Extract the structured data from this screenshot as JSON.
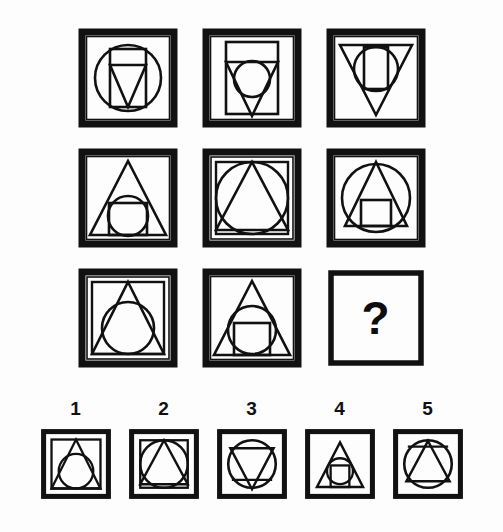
{
  "puzzle": {
    "type": "matrix-reasoning-figure",
    "background_color": "#fdfdfd",
    "ink_color": "#111111",
    "matrix": {
      "rows": 3,
      "columns": 3,
      "cells": [
        {
          "id": "r1c1",
          "position": "row1-col1",
          "outer": "thick-square-border",
          "shapes": [
            "circle-large",
            "rectangle-vertical",
            "triangle-down"
          ],
          "description": "Square frame containing a large circle, a tall vertical rectangle, and a downward-pointing triangle"
        },
        {
          "id": "r1c2",
          "position": "row1-col2",
          "outer": "thick-square-border",
          "shapes": [
            "rectangle-vertical-large",
            "triangle-down",
            "circle-medium"
          ],
          "description": "Square frame containing a large tall rectangle, a downward triangle, and a medium circle"
        },
        {
          "id": "r1c3",
          "position": "row1-col3",
          "outer": "thick-square-border",
          "shapes": [
            "triangle-down-large",
            "circle-medium",
            "rectangle-vertical-small"
          ],
          "description": "Square frame containing a large downward triangle, a circle, and a small vertical rectangle"
        },
        {
          "id": "r2c1",
          "position": "row2-col1",
          "outer": "thick-square-border",
          "shapes": [
            "triangle-up-large",
            "square-small",
            "circle-medium"
          ],
          "description": "Square frame containing a large upward triangle, a small square, and a circle"
        },
        {
          "id": "r2c2",
          "position": "row2-col2",
          "outer": "thick-square-border",
          "shapes": [
            "square-inner-large",
            "circle-large",
            "triangle-up"
          ],
          "description": "Square frame containing an inner square, a large circle, and an upward triangle"
        },
        {
          "id": "r2c3",
          "position": "row2-col3",
          "outer": "thick-square-border",
          "shapes": [
            "circle-large",
            "triangle-up",
            "square-small"
          ],
          "description": "Square frame containing a large circle, an upward triangle, and a small square"
        },
        {
          "id": "r3c1",
          "position": "row3-col1",
          "outer": "thick-square-border",
          "shapes": [
            "square-inner",
            "triangle-up",
            "circle-medium"
          ],
          "description": "Square frame containing an inner square, an upward triangle, and a circle"
        },
        {
          "id": "r3c2",
          "position": "row3-col2",
          "outer": "thick-square-border",
          "shapes": [
            "triangle-up-large",
            "circle-medium",
            "square-small"
          ],
          "description": "Square frame containing a large upward triangle, a circle, and a small square"
        },
        {
          "id": "r3c3",
          "position": "row3-col3",
          "outer": "thin-square-border",
          "shapes": [],
          "is_missing": true,
          "missing_marker": "?",
          "description": "Empty square frame with a question mark — the missing tile"
        }
      ]
    },
    "answer_options": {
      "count": 5,
      "labels": [
        "1",
        "2",
        "3",
        "4",
        "5"
      ],
      "items": [
        {
          "label": "1",
          "outer": "thick-square-border",
          "shapes": [
            "square-inner",
            "triangle-up",
            "circle-medium"
          ],
          "description": "Square frame with inner square, upward triangle and circle"
        },
        {
          "label": "2",
          "outer": "thick-square-border",
          "shapes": [
            "square-inner",
            "circle-large",
            "triangle-up"
          ],
          "description": "Square frame with inner square, large circle and upward triangle"
        },
        {
          "label": "3",
          "outer": "thick-square-border",
          "shapes": [
            "circle-large",
            "triangle-down",
            "rectangle-line"
          ],
          "description": "Square frame with large circle and downward triangle"
        },
        {
          "label": "4",
          "outer": "thick-square-border",
          "shapes": [
            "triangle-up",
            "circle-small",
            "square-tiny"
          ],
          "description": "Square frame with upward triangle, small circle and tiny square"
        },
        {
          "label": "5",
          "outer": "thick-square-border",
          "shapes": [
            "circle-large",
            "triangle-up",
            "rectangle-line"
          ],
          "description": "Square frame with large circle and upward triangle"
        }
      ]
    }
  }
}
